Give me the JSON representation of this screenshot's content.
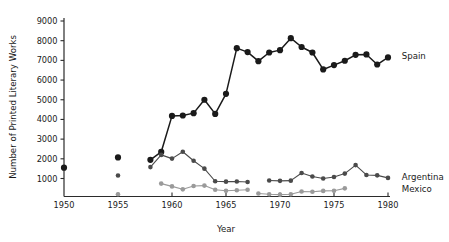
{
  "chart_data": {
    "type": "line",
    "title": "",
    "xlabel": "Year",
    "ylabel": "Number of Printed Literary Works",
    "xlim": [
      1950,
      1980
    ],
    "ylim": [
      0,
      9000
    ],
    "xticks": [
      1950,
      1955,
      1960,
      1965,
      1970,
      1975,
      1980
    ],
    "yticks": [
      1000,
      2000,
      3000,
      4000,
      5000,
      6000,
      7000,
      8000,
      9000
    ],
    "grid": false,
    "legend_position": "right-inline-labels",
    "series": [
      {
        "name": "Spain",
        "color": "#1a1a1a",
        "marker": "circle",
        "marker_size": 3.1,
        "line_width": 1.5,
        "label_x": 1981.0,
        "label_y": 7200,
        "segments": [
          {
            "connected": false,
            "points": [
              [
                1950,
                1550
              ]
            ]
          },
          {
            "connected": false,
            "points": [
              [
                1955,
                2070
              ]
            ]
          },
          {
            "connected": true,
            "points": [
              [
                1958,
                1950
              ],
              [
                1959,
                2350
              ],
              [
                1960,
                4180
              ],
              [
                1961,
                4200
              ],
              [
                1962,
                4320
              ],
              [
                1963,
                5000
              ],
              [
                1964,
                4280
              ],
              [
                1965,
                5300
              ],
              [
                1966,
                7620
              ],
              [
                1967,
                7420
              ],
              [
                1968,
                6960
              ],
              [
                1969,
                7400
              ],
              [
                1970,
                7520
              ],
              [
                1971,
                8130
              ],
              [
                1972,
                7680
              ],
              [
                1973,
                7400
              ],
              [
                1974,
                6540
              ],
              [
                1975,
                6760
              ],
              [
                1976,
                6980
              ],
              [
                1977,
                7280
              ],
              [
                1978,
                7300
              ],
              [
                1979,
                6790
              ],
              [
                1980,
                7150
              ]
            ]
          }
        ]
      },
      {
        "name": "Argentina",
        "color": "#4a4a4a",
        "marker": "circle",
        "marker_size": 2.3,
        "line_width": 1.1,
        "label_x": 1981.0,
        "label_y": 1060,
        "segments": [
          {
            "connected": false,
            "points": [
              [
                1955,
                1150
              ]
            ]
          },
          {
            "connected": true,
            "points": [
              [
                1958,
                1580
              ],
              [
                1959,
                2200
              ],
              [
                1960,
                2010
              ],
              [
                1961,
                2360
              ],
              [
                1962,
                1900
              ],
              [
                1963,
                1500
              ],
              [
                1964,
                860
              ],
              [
                1965,
                840
              ],
              [
                1966,
                850
              ],
              [
                1967,
                820
              ]
            ]
          },
          {
            "connected": true,
            "points": [
              [
                1969,
                900
              ],
              [
                1970,
                880
              ],
              [
                1971,
                890
              ],
              [
                1972,
                1280
              ],
              [
                1973,
                1100
              ],
              [
                1974,
                1000
              ],
              [
                1975,
                1080
              ],
              [
                1976,
                1250
              ],
              [
                1977,
                1680
              ],
              [
                1978,
                1180
              ],
              [
                1979,
                1160
              ],
              [
                1980,
                1030
              ]
            ]
          }
        ]
      },
      {
        "name": "Mexico",
        "color": "#9a9a9a",
        "marker": "circle",
        "marker_size": 2.3,
        "line_width": 1.1,
        "label_x": 1981.0,
        "label_y": 440,
        "segments": [
          {
            "connected": false,
            "points": [
              [
                1955,
                200
              ]
            ]
          },
          {
            "connected": true,
            "points": [
              [
                1959,
                740
              ],
              [
                1960,
                600
              ],
              [
                1961,
                450
              ],
              [
                1962,
                620
              ],
              [
                1963,
                640
              ],
              [
                1964,
                430
              ],
              [
                1965,
                380
              ],
              [
                1966,
                400
              ],
              [
                1967,
                430
              ]
            ]
          },
          {
            "connected": true,
            "points": [
              [
                1968,
                240
              ],
              [
                1969,
                200
              ],
              [
                1970,
                180
              ],
              [
                1971,
                200
              ],
              [
                1972,
                340
              ],
              [
                1973,
                330
              ],
              [
                1974,
                370
              ],
              [
                1975,
                380
              ],
              [
                1976,
                500
              ]
            ]
          }
        ]
      }
    ]
  },
  "labels": {
    "spain": "Spain",
    "argentina": "Argentina",
    "mexico": "Mexico",
    "x_axis_title": "Year",
    "y_axis_title": "Number of Printed Literary Works"
  }
}
